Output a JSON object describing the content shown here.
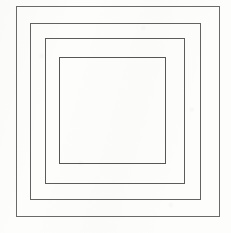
{
  "figure": {
    "canvas": {
      "width": 231,
      "height": 233,
      "background_color": "#fdfdfc",
      "paper_tone": "off-white scanned paper"
    },
    "stroke": {
      "color": "#5f5f5f",
      "width": 1,
      "style": "solid"
    },
    "shape_count": 4,
    "shapes": [
      {
        "name": "outer-rectangle",
        "index": 1,
        "x": 16,
        "y": 6,
        "width": 204,
        "height": 211,
        "stroke_color": "#6a6a6a",
        "stroke_width": 1,
        "fill": "none"
      },
      {
        "name": "second-rectangle",
        "index": 2,
        "x": 30,
        "y": 23,
        "width": 171,
        "height": 177,
        "stroke_color": "#626262",
        "stroke_width": 1,
        "fill": "none"
      },
      {
        "name": "third-rectangle",
        "index": 3,
        "x": 45,
        "y": 38,
        "width": 140,
        "height": 146,
        "stroke_color": "#5c5c5c",
        "stroke_width": 1,
        "fill": "none"
      },
      {
        "name": "inner-rectangle",
        "index": 4,
        "x": 59,
        "y": 57,
        "width": 107,
        "height": 107,
        "stroke_color": "#565656",
        "stroke_width": 1,
        "fill": "none"
      }
    ]
  }
}
